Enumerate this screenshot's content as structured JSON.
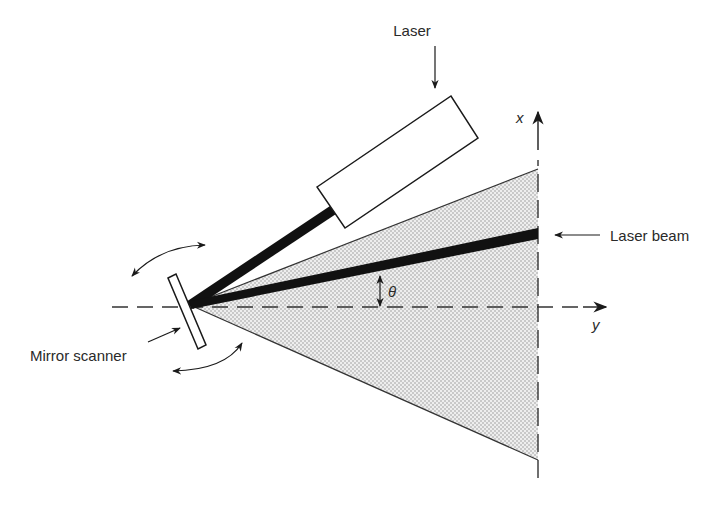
{
  "labels": {
    "laser": "Laser",
    "laser_beam": "Laser beam",
    "mirror_scanner": "Mirror scanner",
    "theta": "θ",
    "axis_x": "x",
    "axis_y": "y"
  },
  "colors": {
    "ink": "#1a1a1a",
    "text": "#2a2a2a",
    "fan_fill": "#e6e6e6",
    "fan_dot": "#9a9a9a",
    "background": "#ffffff"
  }
}
